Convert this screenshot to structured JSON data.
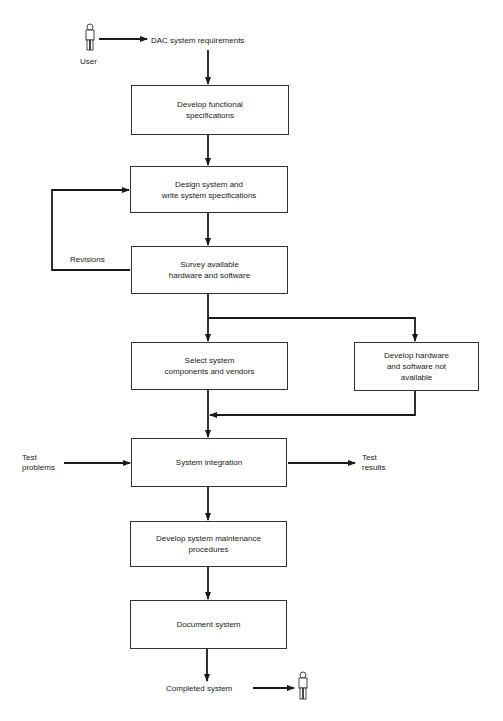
{
  "diagram": {
    "type": "flowchart",
    "actors": {
      "start": {
        "label": "User",
        "icon": "person-icon"
      },
      "end": {
        "icon": "person-icon"
      }
    },
    "start_label": "DAC system requirements",
    "end_label": "Completed system",
    "boxes": [
      {
        "id": "b1",
        "label": "Develop functional\nspecifications"
      },
      {
        "id": "b2",
        "label": "Design system and\nwrite system specifications"
      },
      {
        "id": "b3",
        "label": "Survey available\nhardware and software"
      },
      {
        "id": "b4",
        "label": "Select system\ncomponents and vendors"
      },
      {
        "id": "b5",
        "label": "Develop hardware\nand software not\navailable"
      },
      {
        "id": "b6",
        "label": "System integration"
      },
      {
        "id": "b7",
        "label": "Develop system maintenance\nprocedures"
      },
      {
        "id": "b8",
        "label": "Document system"
      }
    ],
    "side_labels": {
      "revisions": "Revisions",
      "test_problems": "Test\nproblems",
      "test_results": "Test\nresults"
    },
    "edges": [
      [
        "User",
        "DAC system requirements"
      ],
      [
        "DAC system requirements",
        "b1"
      ],
      [
        "b1",
        "b2"
      ],
      [
        "b2",
        "b3"
      ],
      [
        "b3",
        "b2",
        "Revisions"
      ],
      [
        "b3",
        "b4"
      ],
      [
        "b3",
        "b5"
      ],
      [
        "b4",
        "b6"
      ],
      [
        "b5",
        "b6"
      ],
      [
        "Test problems",
        "b6"
      ],
      [
        "b6",
        "Test results"
      ],
      [
        "b6",
        "b7"
      ],
      [
        "b7",
        "b8"
      ],
      [
        "b8",
        "Completed system"
      ],
      [
        "Completed system",
        "User"
      ]
    ]
  },
  "colors": {
    "line": "#1a1a1a",
    "box_border": "#333333",
    "background": "#ffffff"
  }
}
